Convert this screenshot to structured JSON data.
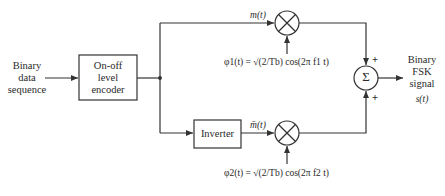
{
  "diagram": {
    "input": {
      "lines": [
        "Binary",
        "data",
        "sequence"
      ]
    },
    "encoder": {
      "lines": [
        "On-off",
        "level",
        "encoder"
      ]
    },
    "inverter": {
      "label": "Inverter"
    },
    "top_branch": {
      "signal_label": "m(t)",
      "carrier_label": "φ1(t) = √(2/Tb) cos(2π f1 t)"
    },
    "bottom_branch": {
      "signal_label": "m̄(t)",
      "carrier_label": "φ2(t) = √(2/Tb) cos(2π f2 t)"
    },
    "summer": {
      "symbol": "Σ",
      "input_signs": [
        "+",
        "+"
      ]
    },
    "output": {
      "lines": [
        "Binary",
        "FSK",
        "signal"
      ],
      "signal_label": "s(t)"
    },
    "colors": {
      "line": "#333333",
      "background": "#ffffff"
    }
  }
}
